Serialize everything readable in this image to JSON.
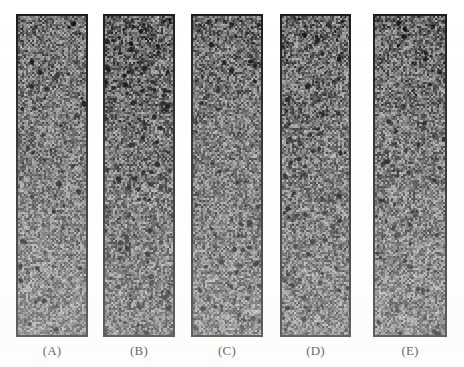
{
  "figure": {
    "background_color": "#ffffff",
    "border_color": "#1b1b1b",
    "label_color": "#1a1a1a",
    "panel_count": 5,
    "caption_text": ""
  },
  "panels": [
    {
      "id": "panel-a",
      "label": "(A)",
      "x": 16,
      "y": 14,
      "width": 72,
      "height": 323,
      "label_x": 16,
      "label_y": 343,
      "label_width": 72,
      "mean_gray": "#707070",
      "texture": {
        "seed": 1101,
        "base_gray": 112,
        "contrast": 58,
        "cell_w": 2,
        "cell_h": 2,
        "speck_density": 0.004,
        "speck_color": "#101010",
        "weave_strength": 0.22,
        "blotch_strength": 0.1
      }
    },
    {
      "id": "panel-b",
      "label": "(B)",
      "x": 103,
      "y": 14,
      "width": 72,
      "height": 323,
      "label_x": 103,
      "label_y": 343,
      "label_width": 72,
      "mean_gray": "#666666",
      "texture": {
        "seed": 2203,
        "base_gray": 102,
        "contrast": 64,
        "cell_w": 2,
        "cell_h": 2,
        "speck_density": 0.009,
        "speck_color": "#0b0b0b",
        "weave_strength": 0.2,
        "blotch_strength": 0.16
      }
    },
    {
      "id": "panel-c",
      "label": "(C)",
      "x": 191,
      "y": 14,
      "width": 72,
      "height": 323,
      "label_x": 191,
      "label_y": 343,
      "label_width": 72,
      "mean_gray": "#6e6e6e",
      "texture": {
        "seed": 3307,
        "base_gray": 110,
        "contrast": 60,
        "cell_w": 2,
        "cell_h": 2,
        "speck_density": 0.005,
        "speck_color": "#0f0f0f",
        "weave_strength": 0.24,
        "blotch_strength": 0.09
      }
    },
    {
      "id": "panel-d",
      "label": "(D)",
      "x": 280,
      "y": 14,
      "width": 71,
      "height": 323,
      "label_x": 280,
      "label_y": 343,
      "label_width": 71,
      "mean_gray": "#6a6a6a",
      "texture": {
        "seed": 4409,
        "base_gray": 106,
        "contrast": 62,
        "cell_w": 2,
        "cell_h": 2,
        "speck_density": 0.0075,
        "speck_color": "#0a0a0a",
        "weave_strength": 0.21,
        "blotch_strength": 0.14
      }
    },
    {
      "id": "panel-e",
      "label": "(E)",
      "x": 373,
      "y": 14,
      "width": 74,
      "height": 323,
      "label_x": 373,
      "label_y": 343,
      "label_width": 74,
      "mean_gray": "#6c6c6c",
      "texture": {
        "seed": 5511,
        "base_gray": 108,
        "contrast": 61,
        "cell_w": 2,
        "cell_h": 2,
        "speck_density": 0.006,
        "speck_color": "#0d0d0d",
        "weave_strength": 0.23,
        "blotch_strength": 0.12
      }
    }
  ]
}
